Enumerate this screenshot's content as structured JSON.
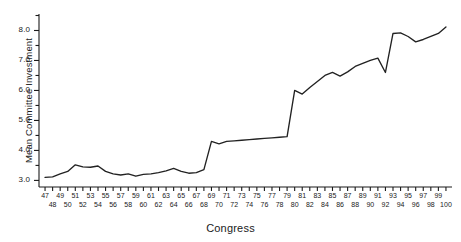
{
  "chart_data": {
    "type": "line",
    "title": "",
    "xlabel": "Congress",
    "ylabel": "Mean Committee Investment",
    "xlim": [
      46.2,
      100.8
    ],
    "ylim": [
      2.78,
      8.55
    ],
    "grid": false,
    "legend": null,
    "x_tick_labels": [
      "47",
      "48",
      "49",
      "50",
      "51",
      "52",
      "53",
      "54",
      "55",
      "56",
      "57",
      "58",
      "59",
      "60",
      "61",
      "62",
      "63",
      "64",
      "65",
      "66",
      "67",
      "68",
      "69",
      "70",
      "71",
      "72",
      "73",
      "74",
      "75",
      "76",
      "77",
      "78",
      "79",
      "80",
      "81",
      "82",
      "83",
      "84",
      "85",
      "86",
      "87",
      "88",
      "89",
      "90",
      "91",
      "92",
      "93",
      "94",
      "95",
      "96",
      "97",
      "98",
      "99",
      "100"
    ],
    "y_tick_labels": [
      "3.0",
      "4.0",
      "5.0",
      "6.0",
      "7.0",
      "8.0"
    ],
    "y_ticks": [
      3.0,
      4.0,
      5.0,
      6.0,
      7.0,
      8.0
    ],
    "y_minor_ticks": [
      3.5,
      4.5,
      5.5,
      6.5,
      7.5,
      8.5
    ],
    "line_color": "#222222",
    "x": [
      47,
      48,
      49,
      50,
      51,
      52,
      53,
      54,
      55,
      56,
      57,
      58,
      59,
      60,
      61,
      62,
      63,
      64,
      65,
      66,
      67,
      68,
      69,
      70,
      71,
      72,
      73,
      74,
      75,
      76,
      77,
      78,
      79,
      80,
      81,
      82,
      83,
      84,
      85,
      86,
      87,
      88,
      89,
      90,
      91,
      92,
      93,
      94,
      95,
      96,
      97,
      98,
      99,
      100
    ],
    "values": [
      3.1,
      3.12,
      3.22,
      3.3,
      3.52,
      3.45,
      3.44,
      3.48,
      3.3,
      3.22,
      3.18,
      3.22,
      3.14,
      3.2,
      3.22,
      3.26,
      3.32,
      3.4,
      3.3,
      3.24,
      3.26,
      3.36,
      4.3,
      4.22,
      4.3,
      4.32,
      4.34,
      4.36,
      4.38,
      4.4,
      4.42,
      4.44,
      4.46,
      6.0,
      5.88,
      6.1,
      6.3,
      6.5,
      6.6,
      6.48,
      6.62,
      6.8,
      6.9,
      7.0,
      7.08,
      6.6,
      7.9,
      7.92,
      7.8,
      7.62,
      7.7,
      7.8,
      7.9,
      8.12
    ]
  }
}
